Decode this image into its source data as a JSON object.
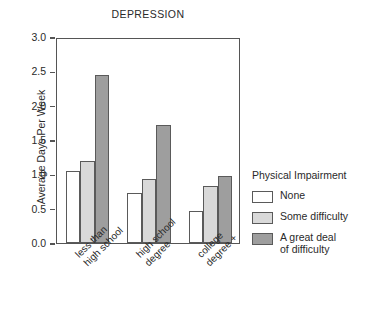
{
  "chart_data": {
    "type": "bar",
    "title": "DEPRESSION",
    "xlabel": "",
    "ylabel": "Average Days Per Week",
    "ylim": [
      0.0,
      3.0
    ],
    "ytick_labels": [
      "3.0",
      "2.5",
      "2.0",
      "1.5",
      "1.0",
      "0.5",
      "0.0"
    ],
    "ytick_values": [
      3.0,
      2.5,
      2.0,
      1.5,
      1.0,
      0.5,
      0.0
    ],
    "grid": false,
    "legend_position": "right",
    "legend_title": "Physical Impairment",
    "categories": [
      "less than\nhigh school",
      "high school\ndegree",
      "college\ndegree +"
    ],
    "category_lines": [
      [
        "less than",
        "high school"
      ],
      [
        "high school",
        "degree"
      ],
      [
        "college",
        "degree +"
      ]
    ],
    "series": [
      {
        "name": "None",
        "color": "#ffffff",
        "values": [
          1.05,
          0.73,
          0.47
        ]
      },
      {
        "name": "Some difficulty",
        "color": "#d9d9d9",
        "values": [
          1.19,
          0.93,
          0.83
        ]
      },
      {
        "name": "A great deal of difficulty",
        "color": "#9e9e9e",
        "values": [
          2.45,
          1.72,
          0.97
        ]
      }
    ],
    "legend_entries": [
      {
        "label_lines": [
          "None"
        ],
        "color": "#ffffff"
      },
      {
        "label_lines": [
          "Some difficulty"
        ],
        "color": "#d9d9d9"
      },
      {
        "label_lines": [
          "A great deal",
          "of difficulty"
        ],
        "color": "#9e9e9e"
      }
    ]
  },
  "colors": {
    "axis": "#555555",
    "text": "#2a2a2a",
    "background": "#ffffff",
    "bar_border": "#5a5a5a"
  }
}
